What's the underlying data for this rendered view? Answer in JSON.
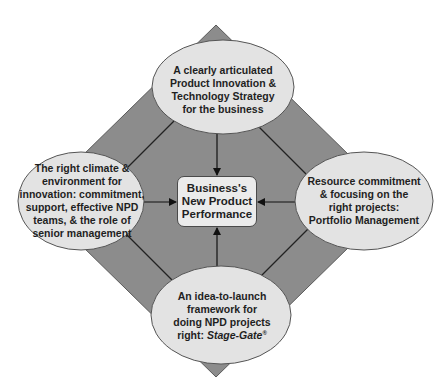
{
  "colors": {
    "diamond_fill": "#8c8c8c",
    "diamond_stroke": "#5a5a5a",
    "ellipse_fill": "#e3e3e3",
    "ellipse_stroke": "#555555",
    "center_fill": "#ebebeb",
    "text": "#1f1f1f"
  },
  "center": {
    "lines": [
      "Business's",
      "New Product",
      "Performance"
    ]
  },
  "nodes": {
    "top": {
      "lines": [
        "A clearly articulated",
        "Product Innovation &",
        "Technology Strategy",
        "for the business"
      ]
    },
    "left": {
      "lines": [
        "The right climate &",
        "environment for",
        "innovation: commitment,",
        "support, effective NPD",
        "teams, & the role of",
        "senior management"
      ]
    },
    "right": {
      "lines": [
        "Resource commitment",
        "& focusing on the",
        "right projects:",
        "Portfolio Management"
      ]
    },
    "bottom": {
      "lines": [
        "An idea-to-launch",
        "framework for",
        "doing NPD projects"
      ],
      "last_prefix": "right: ",
      "last_italic": "Stage-Gate",
      "last_sup": "®"
    }
  }
}
